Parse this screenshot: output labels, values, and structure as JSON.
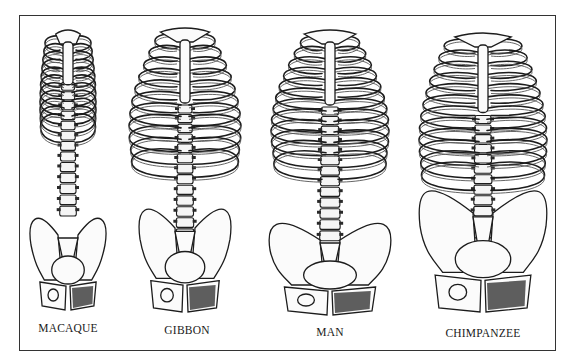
{
  "figure": {
    "panels": [
      {
        "id": "macaque",
        "label": "MACAQUE"
      },
      {
        "id": "gibbon",
        "label": "GIBBON"
      },
      {
        "id": "man",
        "label": "MAN"
      },
      {
        "id": "chimpanzee",
        "label": "CHIMPANZEE"
      }
    ]
  }
}
